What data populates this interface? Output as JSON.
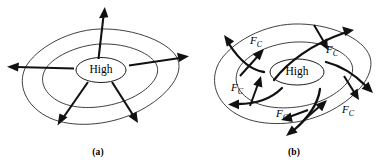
{
  "figure": {
    "background_color": "#ffffff",
    "line_color": "#111111",
    "contour_color": "#2a2a2a",
    "panels": [
      {
        "id": "a",
        "caption": "(a)",
        "center_label": "High",
        "description": "High pressure center with outward pressure gradient force arrows",
        "contour_count": 3,
        "arrow_count": 5,
        "arrow_labels": []
      },
      {
        "id": "b",
        "caption": "(b)",
        "center_label": "High",
        "description": "High pressure center with curving trajectories and Coriolis force arrows",
        "contour_count": 3,
        "arrow_count": 5,
        "arrow_labels": [
          "F",
          "F",
          "F",
          "F",
          "F"
        ],
        "force_symbol": "F",
        "force_subscript": "C"
      }
    ]
  },
  "labels": {
    "high": "High",
    "caption_a": "(a)",
    "caption_b": "(b)",
    "force_symbol": "F",
    "force_subscript": "C"
  },
  "forces": {
    "fc_1": {
      "symbol": "F",
      "sub": "C"
    },
    "fc_2": {
      "symbol": "F",
      "sub": "C"
    },
    "fc_3": {
      "symbol": "F",
      "sub": "C"
    },
    "fc_4": {
      "symbol": "F",
      "sub": "C"
    },
    "fc_5": {
      "symbol": "F",
      "sub": "C"
    }
  }
}
